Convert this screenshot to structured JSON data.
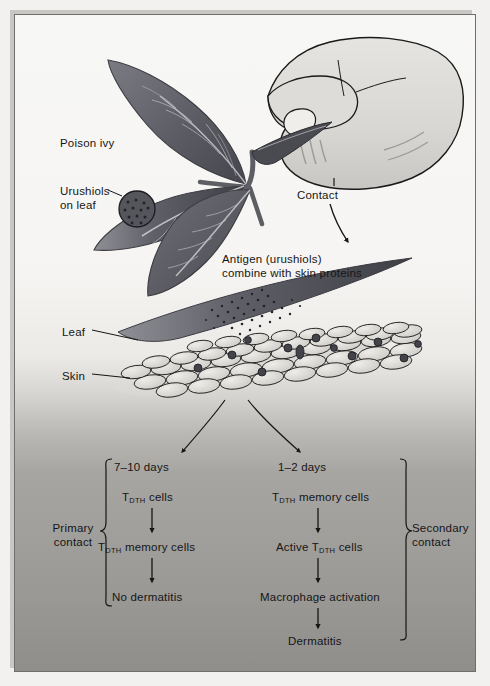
{
  "figure": {
    "type": "biological-process-diagram",
    "labels": {
      "poison_ivy": "Poison ivy",
      "urushiols_on_leaf": "Urushiols\non leaf",
      "urushiols_on_leaf_line1": "Urushiols",
      "urushiols_on_leaf_line2": "on leaf",
      "contact": "Contact",
      "antigen_line1": "Antigen (urushiols)",
      "antigen_line2": "combine with skin proteins",
      "leaf": "Leaf",
      "skin": "Skin"
    },
    "primary_branch": {
      "bracket_label_line1": "Primary",
      "bracket_label_line2": "contact",
      "timing": "7–10 days",
      "steps": [
        {
          "text_before_sub": "T",
          "subscript": "DTH",
          "text_after_sub": " cells"
        },
        {
          "text_before_sub": "T",
          "subscript": "DTH",
          "text_after_sub": " memory cells"
        },
        {
          "text_before_sub": "",
          "subscript": "",
          "text_after_sub": "No dermatitis"
        }
      ],
      "step_labels": [
        "T_DTH cells",
        "T_DTH memory cells",
        "No dermatitis"
      ],
      "outcome": "No dermatitis"
    },
    "secondary_branch": {
      "bracket_label_line1": "Secondary",
      "bracket_label_line2": "contact",
      "timing": "1–2 days",
      "steps": [
        {
          "text_before_sub": "T",
          "subscript": "DTH",
          "text_after_sub": " memory cells"
        },
        {
          "text_before_sub": "Active T",
          "subscript": "DTH",
          "text_after_sub": " cells"
        },
        {
          "text_before_sub": "",
          "subscript": "",
          "text_after_sub": "Macrophage activation"
        },
        {
          "text_before_sub": "",
          "subscript": "",
          "text_after_sub": "Dermatitis"
        }
      ],
      "step_labels": [
        "T_DTH memory cells",
        "Active T_DTH cells",
        "Macrophage activation",
        "Dermatitis"
      ],
      "outcome": "Dermatitis"
    },
    "colors": {
      "ink": "#161616",
      "leaf_dark": "#4f4f55",
      "leaf_mid": "#6d6d74",
      "leaf_light": "#8b8b92",
      "vein": "#cfcfd4",
      "hand_fill": "#dcdad7",
      "hand_outline": "#1a1a1a",
      "skin_cell_fill": "#d9d8d4",
      "skin_cell_stroke": "#1d1d1d",
      "antigen_particle": "#4a4a50",
      "background_top": "#f7f7f5",
      "background_bottom": "#908e8b",
      "frame_border": "#6e6e6e"
    }
  }
}
